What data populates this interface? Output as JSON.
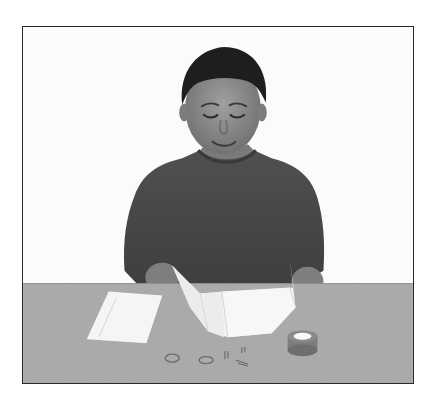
{
  "photo": {
    "alt": "Child seated at a table opening a folded sheet of paper, with an envelope, two rubber bands, paper clips and a roll of tape on the table",
    "style": "grayscale photograph in thin black frame",
    "colors": {
      "background": "#fbfbfb",
      "frame": "#2a2a2a",
      "table": "#a9a9a9",
      "shirt": "#4a4a4a",
      "skin": "#8c8c8c",
      "hair": "#1e1e1e",
      "paper": "#f4f4f4"
    },
    "objects": [
      {
        "name": "child",
        "description": "smiling child in dark sweatshirt looking down"
      },
      {
        "name": "folded-paper",
        "description": "white sheet folded into panels held open"
      },
      {
        "name": "envelope",
        "description": "white envelope lying flat, left side"
      },
      {
        "name": "rubber-bands",
        "count": 2
      },
      {
        "name": "paper-clips",
        "count": 3
      },
      {
        "name": "tape-roll",
        "description": "roll of tape, right side"
      }
    ]
  }
}
